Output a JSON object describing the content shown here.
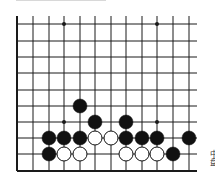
{
  "diagram": {
    "type": "go-board-fragment",
    "columns_x": [
      17,
      33,
      49,
      64,
      80,
      95,
      111,
      126,
      142,
      157,
      173,
      189
    ],
    "rows_y": [
      24,
      41,
      57,
      73,
      90,
      106,
      122,
      138,
      154,
      171
    ],
    "grid_top": 16,
    "line_right_end": 197,
    "star_points": [
      [
        64,
        24
      ],
      [
        157,
        24
      ],
      [
        64,
        122
      ],
      [
        157,
        122
      ]
    ],
    "stones": [
      {
        "color": "black",
        "x": 80,
        "y": 106
      },
      {
        "color": "black",
        "x": 95,
        "y": 122
      },
      {
        "color": "black",
        "x": 126,
        "y": 122
      },
      {
        "color": "black",
        "x": 49,
        "y": 138
      },
      {
        "color": "black",
        "x": 64,
        "y": 138
      },
      {
        "color": "black",
        "x": 80,
        "y": 138
      },
      {
        "color": "white",
        "x": 95,
        "y": 138
      },
      {
        "color": "white",
        "x": 111,
        "y": 138
      },
      {
        "color": "black",
        "x": 126,
        "y": 138
      },
      {
        "color": "black",
        "x": 142,
        "y": 138
      },
      {
        "color": "black",
        "x": 157,
        "y": 138
      },
      {
        "color": "black",
        "x": 189,
        "y": 138
      },
      {
        "color": "black",
        "x": 49,
        "y": 154
      },
      {
        "color": "white",
        "x": 64,
        "y": 154
      },
      {
        "color": "white",
        "x": 80,
        "y": 154
      },
      {
        "color": "white",
        "x": 126,
        "y": 154
      },
      {
        "color": "white",
        "x": 142,
        "y": 154
      },
      {
        "color": "white",
        "x": 157,
        "y": 154
      },
      {
        "color": "black",
        "x": 173,
        "y": 154
      }
    ],
    "stone_radius": 7,
    "colors": {
      "line": "#1a1a1a",
      "black_stone": "#111111",
      "white_stone": "#ffffff"
    }
  },
  "caption": {
    "text": "中盘"
  }
}
